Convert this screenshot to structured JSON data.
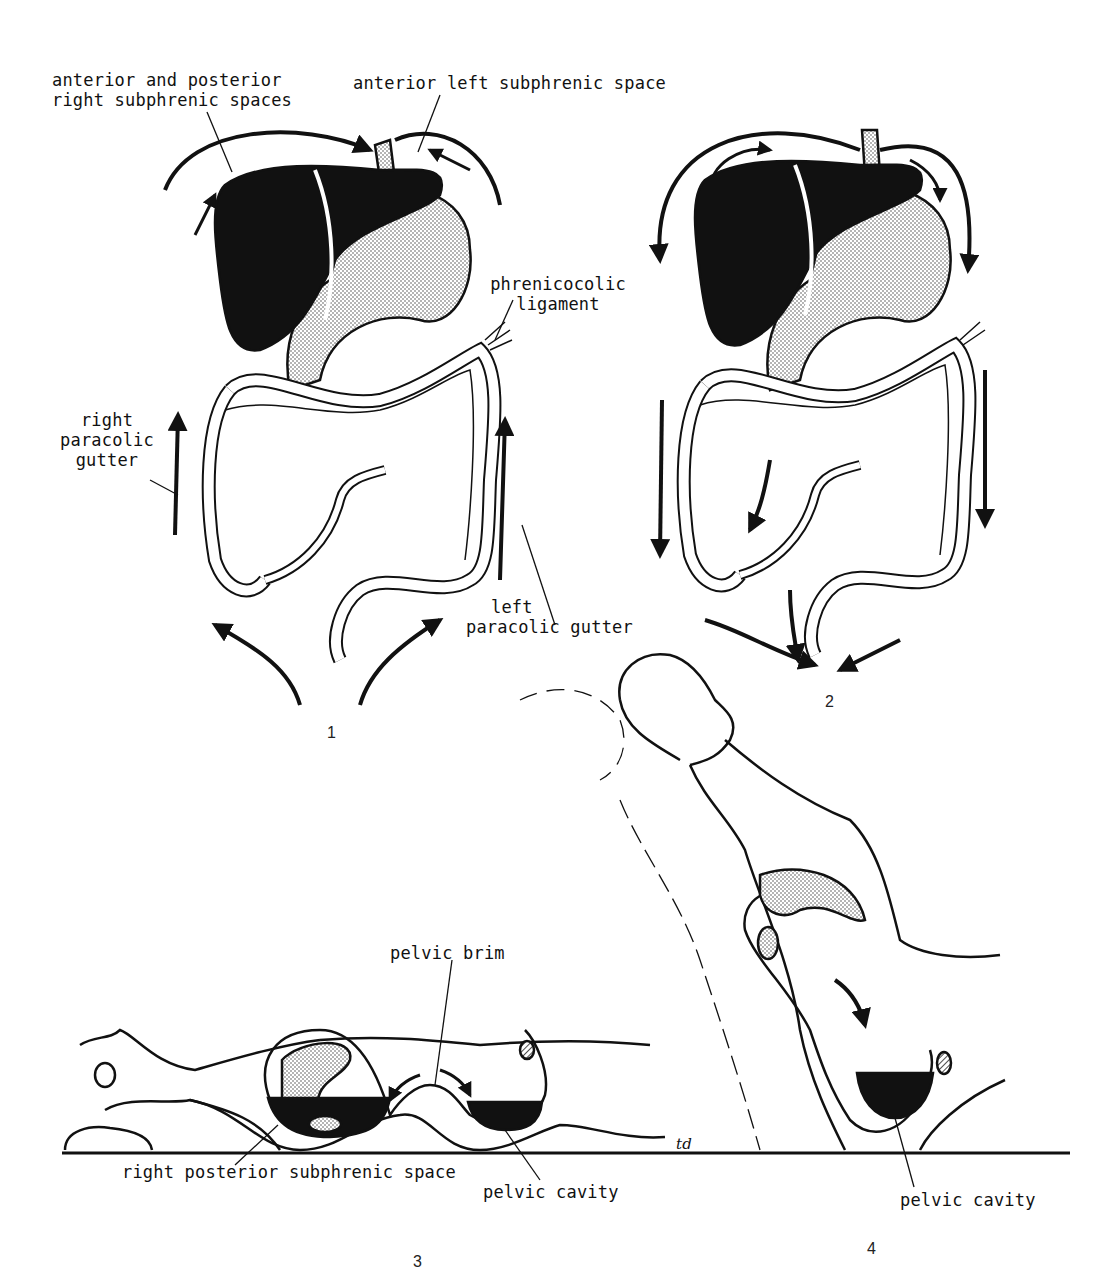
{
  "figure": {
    "panels": [
      {
        "number": "1",
        "description": "Upward flow of peritoneal fluid along paracolic gutters to subphrenic spaces"
      },
      {
        "number": "2",
        "description": "Downward flow of peritoneal fluid toward pelvis"
      },
      {
        "number": "3",
        "description": "Supine patient, fluid collecting in right posterior subphrenic space and pelvic cavity"
      },
      {
        "number": "4",
        "description": "Semi-upright patient, fluid draining into pelvic cavity"
      }
    ],
    "labels": {
      "ant_post_right_subphrenic_line1": "anterior and posterior",
      "ant_post_right_subphrenic_line2": "right subphrenic spaces",
      "ant_left_subphrenic": "anterior left subphrenic space",
      "phrenicocolic_line1": "phrenicocolic",
      "phrenicocolic_line2": "ligament",
      "right_paracolic_line1": "right",
      "right_paracolic_line2": "paracolic",
      "right_paracolic_line3": "gutter",
      "left_paracolic_line1": "left",
      "left_paracolic_line2": "paracolic gutter",
      "pelvic_brim": "pelvic brim",
      "right_post_subphrenic": "right posterior subphrenic space",
      "pelvic_cavity_3": "pelvic cavity",
      "pelvic_cavity_4": "pelvic cavity",
      "signature": "td"
    },
    "colors": {
      "ink": "#111111",
      "stipple": "#c8c8c8",
      "background": "#ffffff"
    }
  }
}
